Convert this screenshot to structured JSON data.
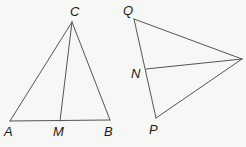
{
  "diagram": {
    "background": "#f7f7f5",
    "stroke_color": "#555555",
    "label_color": "#1a1a1a",
    "figures": [
      {
        "name": "triangle-ABC",
        "vertices": {
          "A": {
            "label": "A",
            "x": 10,
            "y": 121,
            "lx": 4,
            "ly": 136
          },
          "B": {
            "label": "B",
            "x": 110,
            "y": 120,
            "lx": 104,
            "ly": 136
          },
          "C": {
            "label": "C",
            "x": 72,
            "y": 22,
            "lx": 70,
            "ly": 16
          }
        },
        "points_on_sides": {
          "M": {
            "label": "M",
            "x": 60,
            "y": 121,
            "lx": 53,
            "ly": 136,
            "on_side": "AB"
          }
        },
        "segments": [
          "AB",
          "BC",
          "CA",
          "CM"
        ]
      },
      {
        "name": "triangle-QRP",
        "vertices": {
          "Q": {
            "label": "Q",
            "x": 134,
            "y": 19,
            "lx": 123,
            "ly": 15
          },
          "R": {
            "label": "",
            "x": 242,
            "y": 59
          },
          "P": {
            "label": "P",
            "x": 156,
            "y": 118,
            "lx": 149,
            "ly": 134
          }
        },
        "points_on_sides": {
          "N": {
            "label": "N",
            "x": 146,
            "y": 69,
            "lx": 131,
            "ly": 78,
            "on_side": "QP"
          }
        },
        "segments": [
          "QR",
          "RP",
          "PQ",
          "NR"
        ]
      }
    ],
    "labels": {
      "A": "A",
      "B": "B",
      "C": "C",
      "M": "M",
      "Q": "Q",
      "N": "N",
      "P": "P"
    }
  }
}
